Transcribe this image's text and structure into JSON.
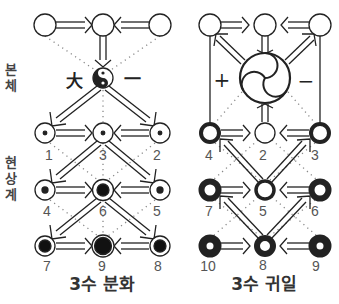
{
  "side_labels": {
    "noumenon": [
      "본",
      "체"
    ],
    "phenomenon": [
      "현",
      "상",
      "계"
    ]
  },
  "left_diagram": {
    "title": "3수 분화",
    "center_symbol": "taeguk-yin-yang",
    "center_left_glyph": "大",
    "center_right_glyph": "一",
    "node_labels": {
      "row1": [
        "1",
        "3",
        "2"
      ],
      "row2": [
        "4",
        "6",
        "5"
      ],
      "row3": [
        "7",
        "9",
        "8"
      ]
    }
  },
  "right_diagram": {
    "title": "3수 귀일",
    "center_symbol": "sam-taeguk",
    "center_left_glyph": "+",
    "center_right_glyph": "−",
    "node_labels": {
      "row1": [
        "4",
        "2",
        "3"
      ],
      "row2": [
        "7",
        "5",
        "6"
      ],
      "row3": [
        "10",
        "8",
        "9"
      ]
    }
  },
  "colors": {
    "stroke": "#222222",
    "dotted": "#888888",
    "label": "#555555",
    "background": "#ffffff"
  }
}
